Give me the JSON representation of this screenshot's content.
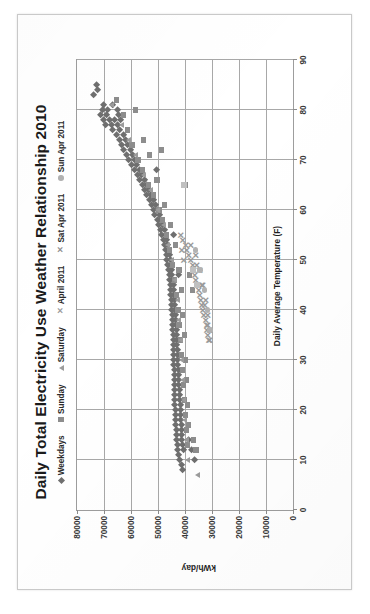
{
  "chart_data": {
    "type": "scatter",
    "title": "Daily Total Electricity Use Weather Relationship 2010",
    "xlabel": "Daily Average Temperature (F)",
    "ylabel": "kWh/day",
    "xlim": [
      0,
      90
    ],
    "ylim": [
      0,
      80000
    ],
    "xticks": [
      0,
      10,
      20,
      30,
      40,
      50,
      60,
      70,
      80,
      90
    ],
    "yticks": [
      0,
      10000,
      20000,
      30000,
      40000,
      50000,
      60000,
      70000,
      80000
    ],
    "xtick_labels": [
      "0",
      "10",
      "20",
      "30",
      "40",
      "50",
      "60",
      "70",
      "80",
      "90"
    ],
    "ytick_labels": [
      "0",
      "10000",
      "20000",
      "30000",
      "40000",
      "50000",
      "60000",
      "70000",
      "80000"
    ],
    "grid": "vertical-and-horizontal",
    "legend_position": "top",
    "orientation_note": "chart printed rotated 90 degrees counter-clockwise on the page",
    "legend": [
      {
        "name": "Weekdays",
        "marker": "diamond",
        "color": "#6f6f6f"
      },
      {
        "name": "Sunday",
        "marker": "square",
        "color": "#8d8d8d"
      },
      {
        "name": "Saturday",
        "marker": "triangle",
        "color": "#9c9c9c"
      },
      {
        "name": "April 2011",
        "marker": "x",
        "color": "#9a9a9a"
      },
      {
        "name": "Sat Apr 2011",
        "marker": "x",
        "color": "#8e8e8e"
      },
      {
        "name": "Sun Apr 2011",
        "marker": "circle",
        "color": "#b2b2b2"
      }
    ],
    "series": [
      {
        "name": "Weekdays",
        "marker": "diamond",
        "points": [
          [
            83,
            73800
          ],
          [
            84,
            72600
          ],
          [
            85,
            73000
          ],
          [
            81,
            70200
          ],
          [
            80,
            70600
          ],
          [
            80,
            68900
          ],
          [
            79,
            71500
          ],
          [
            79,
            69000
          ],
          [
            78,
            70400
          ],
          [
            78,
            68200
          ],
          [
            77,
            69600
          ],
          [
            77,
            67300
          ],
          [
            81,
            66800
          ],
          [
            80,
            65200
          ],
          [
            79,
            64600
          ],
          [
            78,
            66100
          ],
          [
            78,
            63800
          ],
          [
            77,
            65000
          ],
          [
            76,
            66800
          ],
          [
            76,
            64200
          ],
          [
            75,
            65600
          ],
          [
            75,
            63000
          ],
          [
            74,
            64400
          ],
          [
            74,
            62100
          ],
          [
            73,
            63600
          ],
          [
            73,
            61200
          ],
          [
            72,
            62800
          ],
          [
            72,
            60400
          ],
          [
            71,
            61800
          ],
          [
            71,
            59600
          ],
          [
            70,
            60900
          ],
          [
            70,
            58700
          ],
          [
            69,
            59800
          ],
          [
            69,
            57900
          ],
          [
            68,
            58900
          ],
          [
            68,
            57000
          ],
          [
            67,
            57800
          ],
          [
            67,
            56100
          ],
          [
            66,
            56900
          ],
          [
            66,
            55200
          ],
          [
            65,
            56000
          ],
          [
            65,
            54300
          ],
          [
            64,
            55100
          ],
          [
            64,
            53500
          ],
          [
            63,
            54200
          ],
          [
            63,
            52700
          ],
          [
            62,
            53400
          ],
          [
            62,
            51900
          ],
          [
            61,
            52600
          ],
          [
            61,
            51100
          ],
          [
            60,
            51800
          ],
          [
            60,
            50300
          ],
          [
            59,
            51200
          ],
          [
            59,
            49700
          ],
          [
            58,
            50400
          ],
          [
            58,
            49000
          ],
          [
            57,
            49900
          ],
          [
            57,
            48400
          ],
          [
            56,
            49200
          ],
          [
            56,
            47800
          ],
          [
            55,
            48700
          ],
          [
            55,
            47300
          ],
          [
            54,
            48200
          ],
          [
            54,
            46900
          ],
          [
            53,
            47800
          ],
          [
            53,
            46500
          ],
          [
            52,
            47400
          ],
          [
            52,
            46200
          ],
          [
            51,
            47100
          ],
          [
            51,
            45900
          ],
          [
            50,
            46800
          ],
          [
            50,
            45600
          ],
          [
            49,
            46500
          ],
          [
            49,
            45400
          ],
          [
            48,
            46200
          ],
          [
            48,
            45100
          ],
          [
            47,
            46000
          ],
          [
            47,
            44900
          ],
          [
            46,
            45800
          ],
          [
            46,
            44700
          ],
          [
            45,
            45600
          ],
          [
            45,
            44500
          ],
          [
            44,
            45400
          ],
          [
            44,
            44300
          ],
          [
            43,
            45300
          ],
          [
            43,
            44200
          ],
          [
            42,
            45100
          ],
          [
            42,
            44000
          ],
          [
            41,
            45000
          ],
          [
            41,
            43900
          ],
          [
            40,
            44900
          ],
          [
            40,
            43800
          ],
          [
            39,
            44800
          ],
          [
            39,
            43700
          ],
          [
            38,
            44700
          ],
          [
            38,
            43600
          ],
          [
            37,
            44600
          ],
          [
            37,
            43500
          ],
          [
            36,
            44600
          ],
          [
            36,
            43400
          ],
          [
            35,
            44500
          ],
          [
            35,
            43300
          ],
          [
            34,
            44400
          ],
          [
            34,
            43200
          ],
          [
            33,
            44400
          ],
          [
            33,
            43100
          ],
          [
            32,
            44300
          ],
          [
            32,
            43000
          ],
          [
            31,
            44300
          ],
          [
            31,
            42900
          ],
          [
            30,
            44200
          ],
          [
            30,
            42800
          ],
          [
            29,
            44200
          ],
          [
            29,
            42700
          ],
          [
            28,
            44100
          ],
          [
            28,
            42600
          ],
          [
            27,
            44100
          ],
          [
            27,
            42500
          ],
          [
            26,
            44000
          ],
          [
            26,
            42400
          ],
          [
            25,
            44000
          ],
          [
            25,
            42300
          ],
          [
            24,
            43900
          ],
          [
            24,
            42200
          ],
          [
            23,
            43900
          ],
          [
            23,
            42100
          ],
          [
            22,
            43800
          ],
          [
            22,
            42000
          ],
          [
            21,
            43800
          ],
          [
            21,
            41900
          ],
          [
            20,
            43700
          ],
          [
            20,
            41800
          ],
          [
            19,
            43700
          ],
          [
            19,
            41700
          ],
          [
            18,
            43600
          ],
          [
            18,
            41600
          ],
          [
            17,
            43500
          ],
          [
            17,
            41500
          ],
          [
            16,
            43400
          ],
          [
            16,
            41400
          ],
          [
            15,
            43300
          ],
          [
            15,
            41300
          ],
          [
            14,
            43200
          ],
          [
            14,
            41200
          ],
          [
            13,
            43000
          ],
          [
            13,
            41000
          ],
          [
            12,
            42700
          ],
          [
            12,
            40700
          ],
          [
            11,
            42400
          ],
          [
            10,
            42000
          ],
          [
            9,
            41500
          ],
          [
            8,
            41000
          ],
          [
            68,
            50600
          ],
          [
            55,
            44400
          ],
          [
            47,
            42500
          ],
          [
            14,
            38800
          ],
          [
            12,
            37600
          ],
          [
            10,
            36400
          ]
        ]
      },
      {
        "name": "Sunday",
        "marker": "square",
        "points": [
          [
            82,
            65400
          ],
          [
            79,
            62800
          ],
          [
            76,
            61400
          ],
          [
            73,
            59600
          ],
          [
            70,
            57400
          ],
          [
            68,
            55800
          ],
          [
            65,
            53600
          ],
          [
            63,
            51800
          ],
          [
            60,
            49600
          ],
          [
            58,
            48200
          ],
          [
            55,
            46800
          ],
          [
            52,
            45600
          ],
          [
            49,
            44600
          ],
          [
            46,
            43800
          ],
          [
            43,
            43200
          ],
          [
            40,
            42600
          ],
          [
            37,
            42200
          ],
          [
            34,
            41800
          ],
          [
            31,
            41400
          ],
          [
            28,
            41000
          ],
          [
            25,
            40600
          ],
          [
            22,
            40200
          ],
          [
            19,
            39800
          ],
          [
            16,
            39400
          ],
          [
            13,
            39000
          ],
          [
            80,
            58200
          ],
          [
            74,
            55400
          ],
          [
            71,
            53200
          ],
          [
            66,
            50400
          ],
          [
            61,
            47600
          ],
          [
            57,
            45400
          ],
          [
            53,
            43600
          ],
          [
            48,
            42200
          ],
          [
            44,
            41400
          ],
          [
            39,
            40800
          ],
          [
            35,
            40300
          ],
          [
            30,
            39900
          ],
          [
            26,
            39500
          ],
          [
            21,
            39100
          ],
          [
            17,
            38700
          ],
          [
            72,
            48800
          ],
          [
            65,
            40000
          ],
          [
            47,
            38400
          ],
          [
            44,
            37200
          ],
          [
            14,
            36800
          ],
          [
            12,
            35900
          ]
        ]
      },
      {
        "name": "Saturday",
        "marker": "triangle",
        "points": [
          [
            81,
            67200
          ],
          [
            77,
            63400
          ],
          [
            74,
            60800
          ],
          [
            71,
            58200
          ],
          [
            67,
            55400
          ],
          [
            64,
            52800
          ],
          [
            60,
            50200
          ],
          [
            57,
            48000
          ],
          [
            53,
            46200
          ],
          [
            50,
            44800
          ],
          [
            46,
            43600
          ],
          [
            42,
            42800
          ],
          [
            38,
            42200
          ],
          [
            34,
            41700
          ],
          [
            30,
            41200
          ],
          [
            26,
            40800
          ],
          [
            22,
            40400
          ],
          [
            18,
            40000
          ],
          [
            14,
            39500
          ],
          [
            10,
            38900
          ],
          [
            7,
            35200
          ]
        ]
      },
      {
        "name": "April 2011",
        "marker": "x",
        "points": [
          [
            54,
            40600
          ],
          [
            53,
            39800
          ],
          [
            52,
            39200
          ],
          [
            51,
            38400
          ],
          [
            50,
            37800
          ],
          [
            49,
            37200
          ],
          [
            48,
            36800
          ],
          [
            47,
            36200
          ],
          [
            46,
            35800
          ],
          [
            45,
            35200
          ],
          [
            44,
            34800
          ],
          [
            43,
            34400
          ],
          [
            42,
            34000
          ],
          [
            41,
            33600
          ],
          [
            40,
            33200
          ],
          [
            39,
            32800
          ],
          [
            38,
            32400
          ],
          [
            37,
            32000
          ],
          [
            36,
            31800
          ],
          [
            35,
            31400
          ],
          [
            34,
            31000
          ],
          [
            51,
            35800
          ],
          [
            48,
            34600
          ],
          [
            45,
            33400
          ],
          [
            42,
            32400
          ],
          [
            39,
            31600
          ],
          [
            36,
            30900
          ],
          [
            50,
            40200
          ],
          [
            52,
            41000
          ],
          [
            55,
            41400
          ]
        ]
      },
      {
        "name": "Sat Apr 2011",
        "marker": "x",
        "points": [
          [
            53,
            37600
          ],
          [
            49,
            35400
          ],
          [
            45,
            33800
          ],
          [
            41,
            32600
          ],
          [
            37,
            31400
          ],
          [
            34,
            30600
          ]
        ]
      },
      {
        "name": "Sun Apr 2011",
        "marker": "circle",
        "points": [
          [
            52,
            36200
          ],
          [
            48,
            34400
          ],
          [
            44,
            32800
          ],
          [
            40,
            31600
          ],
          [
            36,
            30700
          ]
        ]
      },
      {
        "name": "Outliers",
        "marker": "light-square",
        "points": [
          [
            65,
            40200
          ],
          [
            48,
            37000
          ],
          [
            45,
            35600
          ]
        ]
      }
    ]
  }
}
